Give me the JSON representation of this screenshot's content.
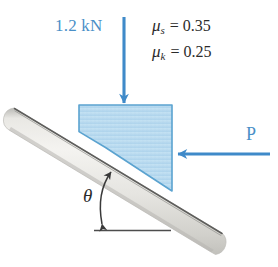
{
  "figure": {
    "type": "free-body-diagram",
    "background_color": "#ffffff"
  },
  "labels": {
    "weight": "1.2 kN",
    "applied_force": "P",
    "angle": "θ",
    "mu_static": {
      "symbol": "μ",
      "subscript": "s",
      "equals": "= 0.35",
      "full": "μₛ = 0.35",
      "value": "0.35"
    },
    "mu_kinetic": {
      "symbol": "μ",
      "subscript": "k",
      "equals": "= 0.25",
      "full": "μₖ = 0.25",
      "value": "0.25"
    }
  },
  "colors": {
    "force_blue": "#4a8fc7",
    "arrow_blue": "#3f8ac9",
    "block_fill": "#bcdcf0",
    "block_border": "#5ba3d0",
    "incline_fill": "#e4e3df",
    "incline_edge": "#6a6a68",
    "text_dark": "#2b2b2b",
    "baseline": "#4d4d4d"
  },
  "geometry": {
    "incline_angle_deg": 31,
    "block": {
      "left": 79,
      "top": 105,
      "right": 172
    },
    "weight_arrow": {
      "x": 124,
      "y_start": 17,
      "y_end": 105
    },
    "force_arrow": {
      "y": 154,
      "x_start": 270,
      "x_end": 170
    },
    "baseline": {
      "y": 230,
      "x_start": 94,
      "x_end": 170
    }
  }
}
